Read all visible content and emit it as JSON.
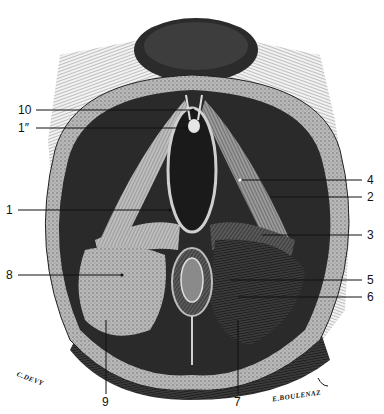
{
  "figure": {
    "type": "anatomical engraving",
    "labels": [
      {
        "id": "10",
        "text": "10",
        "side": "left",
        "x": 18,
        "y": 109
      },
      {
        "id": "1pp",
        "text": "1″",
        "side": "left",
        "x": 18,
        "y": 127
      },
      {
        "id": "1",
        "text": "1",
        "side": "left",
        "x": 6,
        "y": 210
      },
      {
        "id": "8",
        "text": "8",
        "side": "left",
        "x": 6,
        "y": 275
      },
      {
        "id": "9",
        "text": "9",
        "side": "bottom",
        "x": 103,
        "y": 398
      },
      {
        "id": "4",
        "text": "4",
        "side": "right",
        "x": 366,
        "y": 179
      },
      {
        "id": "2",
        "text": "2",
        "side": "right",
        "x": 366,
        "y": 196
      },
      {
        "id": "3",
        "text": "3",
        "side": "right",
        "x": 366,
        "y": 234
      },
      {
        "id": "5",
        "text": "5",
        "side": "right",
        "x": 366,
        "y": 279
      },
      {
        "id": "6",
        "text": "6",
        "side": "right",
        "x": 366,
        "y": 297
      },
      {
        "id": "7",
        "text": "7",
        "side": "bottom",
        "x": 234,
        "y": 398
      }
    ],
    "signatures": {
      "left": "C.DEVY",
      "right": "E.BOULENAZ"
    },
    "colors": {
      "ink": "#111111",
      "paper": "#ffffff",
      "mid": "#777777",
      "light": "#cfcfcf"
    }
  }
}
